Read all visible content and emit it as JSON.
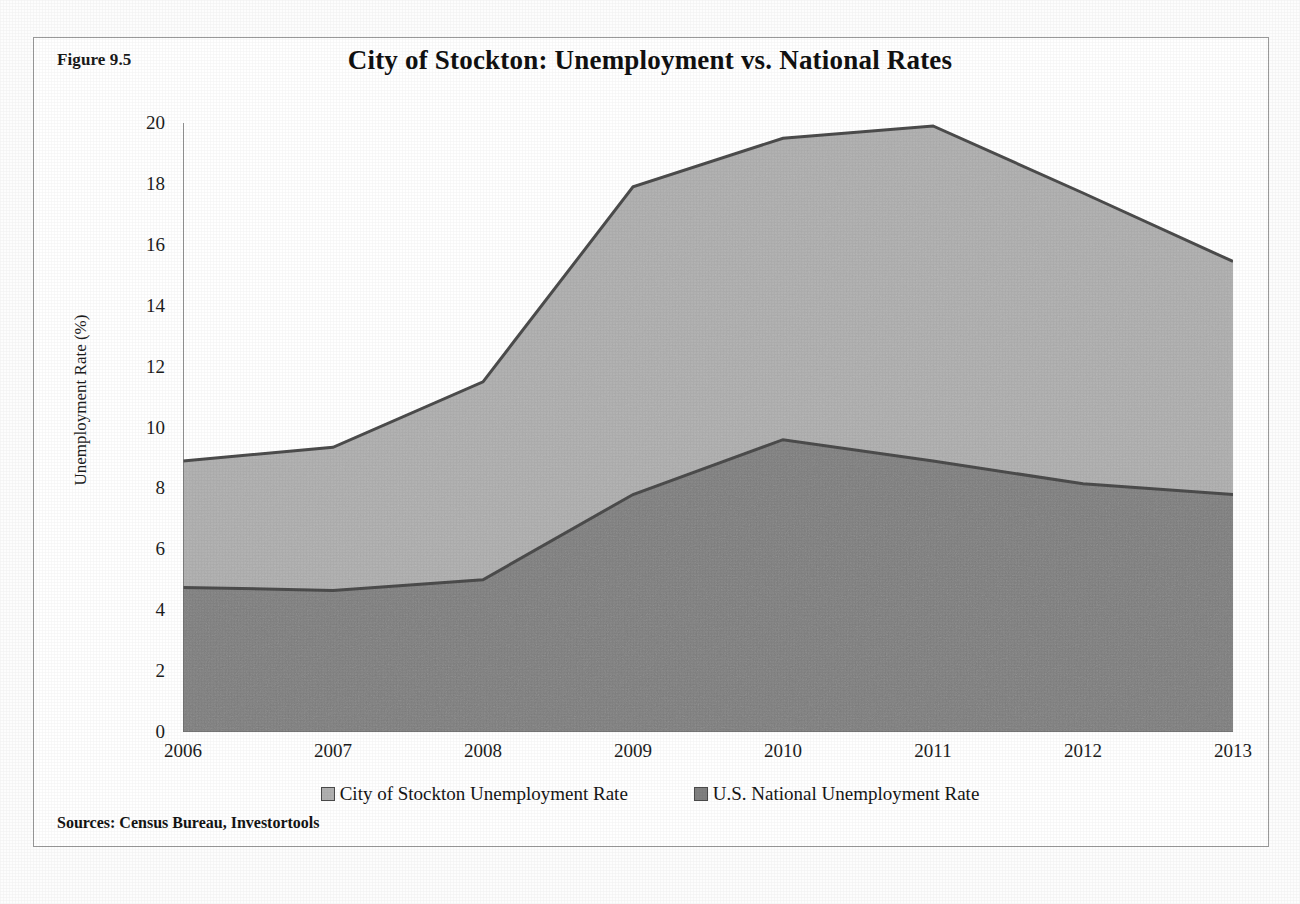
{
  "figure": {
    "label": "Figure 9.5",
    "sources": "Sources: Census Bureau, Investortools"
  },
  "colors": {
    "stockton_fill": "#b0b0b0",
    "national_fill": "#808080",
    "line": "#4c4c4c",
    "axis": "#6f6f6f",
    "text": "#1a1a1a"
  },
  "legend": {
    "position": "bottom",
    "items": [
      {
        "label": "City of Stockton Unemployment Rate",
        "color": "#b0b0b0"
      },
      {
        "label": "U.S. National Unemployment Rate",
        "color": "#808080"
      }
    ]
  },
  "chart_data": {
    "type": "area",
    "title": "City of Stockton: Unemployment vs. National Rates",
    "xlabel": "",
    "ylabel": "Unemployment Rate (%)",
    "categories": [
      "2006",
      "2007",
      "2008",
      "2009",
      "2010",
      "2011",
      "2012",
      "2013"
    ],
    "x": [
      2006,
      2007,
      2008,
      2009,
      2010,
      2011,
      2012,
      2013
    ],
    "xlim": [
      2006,
      2013
    ],
    "ylim": [
      0,
      20
    ],
    "ytick_labels": [
      "0",
      "2",
      "4",
      "6",
      "8",
      "10",
      "12",
      "14",
      "16",
      "18",
      "20"
    ],
    "yticks": [
      0,
      2,
      4,
      6,
      8,
      10,
      12,
      14,
      16,
      18,
      20
    ],
    "grid": false,
    "stacked": false,
    "series": [
      {
        "name": "City of Stockton Unemployment Rate",
        "color": "#b0b0b0",
        "values": [
          8.9,
          9.35,
          11.5,
          17.9,
          19.5,
          19.9,
          17.7,
          15.45
        ]
      },
      {
        "name": "U.S. National Unemployment Rate",
        "color": "#808080",
        "values": [
          4.75,
          4.65,
          5.0,
          7.8,
          9.6,
          8.9,
          8.15,
          7.8
        ]
      }
    ]
  }
}
